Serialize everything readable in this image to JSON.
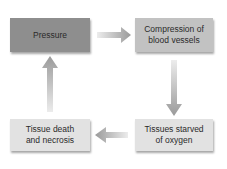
{
  "diagram": {
    "type": "cycle-flowchart",
    "nodes": [
      {
        "id": "pressure",
        "label": "Pressure"
      },
      {
        "id": "compression",
        "label": "Compression of blood vessels"
      },
      {
        "id": "starved",
        "label": "Tissues starved of oxygen"
      },
      {
        "id": "necrosis",
        "label": "Tissue death and necrosis"
      }
    ],
    "edges": [
      {
        "from": "pressure",
        "to": "compression"
      },
      {
        "from": "compression",
        "to": "starved"
      },
      {
        "from": "starved",
        "to": "necrosis"
      },
      {
        "from": "necrosis",
        "to": "pressure"
      }
    ],
    "colors": {
      "pressure_box": "#8e8e8e",
      "compression_box": "#c2c2c2",
      "bottom_boxes": "#e2e2e2",
      "arrows": "#9a9a9a"
    }
  }
}
